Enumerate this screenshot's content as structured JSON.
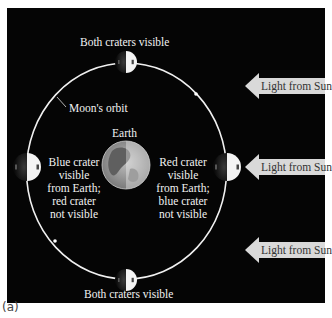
{
  "figure": {
    "caption": "(a)",
    "labels": {
      "top_moon": "Both craters visible",
      "bottom_moon": "Both craters visible",
      "orbit": "Moon's orbit",
      "earth": "Earth",
      "left_moon_lines": [
        "Blue crater",
        "visible",
        "from Earth;",
        "red crater",
        "not visible"
      ],
      "right_moon_lines": [
        "Red crater",
        "visible",
        "from Earth;",
        "blue crater",
        "not visible"
      ]
    },
    "sunlight_arrows": [
      {
        "label": "Light from Sun"
      },
      {
        "label": "Light from Sun"
      },
      {
        "label": "Light from Sun"
      }
    ],
    "colors": {
      "background": "#050505",
      "orbit": "#f0f0f0",
      "text": "#f2f2f2",
      "arrow_fill": "#d9d9d9",
      "arrow_text": "#333333"
    }
  }
}
